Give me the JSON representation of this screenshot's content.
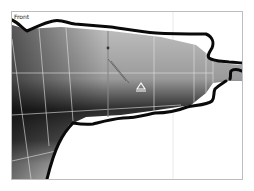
{
  "viewport": {
    "label": "Front",
    "colors": {
      "frame": "#bdbdbd",
      "background": "#ffffff",
      "grid": "#d9d9d9",
      "mesh_light": "#b8b8b8",
      "mesh_dark": "#111111",
      "wire": "#e6e6e6",
      "outline": "#0a0a0a"
    },
    "icons": {
      "gizmo": "triangle-pivot-icon"
    }
  }
}
